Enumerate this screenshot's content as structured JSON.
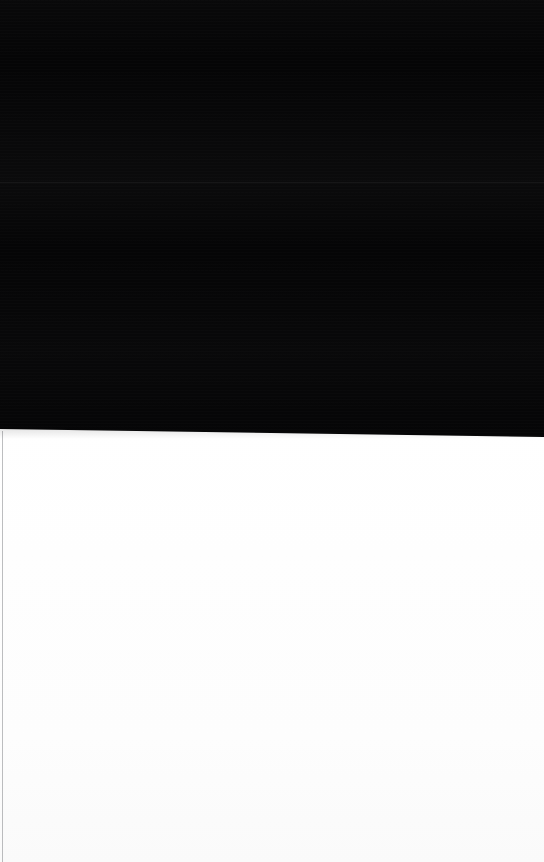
{
  "screen": {
    "width": 544,
    "height": 862,
    "description": "Blank two-tone screen capture: solid black upper region over a solid white lower region.",
    "state_label": "Blank screen — no UI content rendered"
  },
  "regions": {
    "top": {
      "name": "dark-region",
      "color": "#050506",
      "x": 0,
      "y": 0,
      "width": 544,
      "height": 433,
      "note": "Uniform black field. No text, icons, or controls visible. Slight horizontal banding from image compression."
    },
    "bottom": {
      "name": "light-region",
      "color": "#fdfdfd",
      "x": 0,
      "y": 433,
      "width": 544,
      "height": 429,
      "note": "Uniform white field. No text, icons, or controls visible."
    }
  },
  "divider": {
    "name": "horizontal-divider",
    "left_edge_y": 429,
    "right_edge_y": 437,
    "tilt_degrees": 0.85,
    "note": "Boundary between the black and white regions is tilted slightly downward from left to right."
  },
  "left_rule": {
    "name": "left-edge-rule",
    "color": "#5a5c62",
    "x": 2,
    "y": 431,
    "width": 1,
    "height": 431,
    "note": "Faint thin vertical line running down the left edge of the white region."
  },
  "content": {
    "text_elements": [],
    "icons": [],
    "buttons": [],
    "inputs": [],
    "note": "No legible interface elements are present in this capture."
  }
}
